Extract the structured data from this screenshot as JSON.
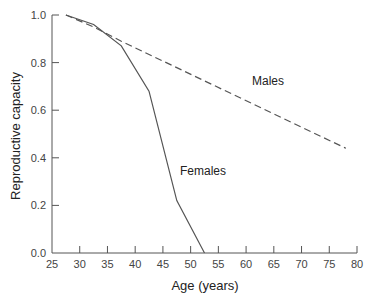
{
  "chart_data": {
    "type": "line",
    "title": "",
    "xlabel": "Age (years)",
    "ylabel": "Reproductive capacity",
    "xlim": [
      25,
      80
    ],
    "ylim": [
      0.0,
      1.0
    ],
    "x_ticks": [
      25,
      30,
      35,
      40,
      45,
      50,
      55,
      60,
      65,
      70,
      75,
      80
    ],
    "y_ticks": [
      0.0,
      0.2,
      0.4,
      0.6,
      0.8,
      1.0
    ],
    "y_tick_labels": [
      "0.0",
      "0.2",
      "0.4",
      "0.6",
      "0.8",
      "1.0"
    ],
    "grid": false,
    "legend": "none (inline annotations)",
    "series": [
      {
        "name": "Males",
        "style": "dashed",
        "x": [
          27.5,
          32.5,
          37.5,
          78.0
        ],
        "y": [
          1.0,
          0.95,
          0.89,
          0.44
        ]
      },
      {
        "name": "Females",
        "style": "solid",
        "x": [
          27.5,
          32.5,
          37.5,
          42.5,
          47.5,
          52.5
        ],
        "y": [
          1.0,
          0.96,
          0.87,
          0.68,
          0.22,
          0.0
        ]
      }
    ],
    "annotations": [
      {
        "text": "Males",
        "x": 61,
        "y": 0.73
      },
      {
        "text": "Females",
        "x": 48.5,
        "y": 0.37
      }
    ]
  },
  "labels": {
    "males": "Males",
    "females": "Females",
    "xlabel": "Age (years)",
    "ylabel": "Reproductive capacity"
  },
  "colors": {
    "axis": "#555555",
    "line": "#555555",
    "text": "#222222"
  }
}
